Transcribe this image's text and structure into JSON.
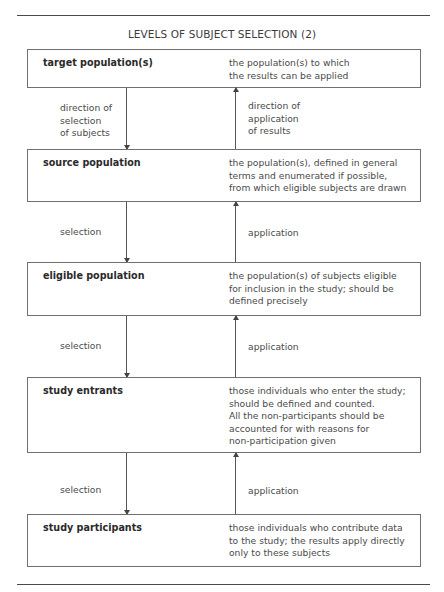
{
  "title": "LEVELS OF SUBJECT SELECTION (2)",
  "levels": [
    {
      "name": "target population(s)",
      "description": "the population(s) to which\nthe results can be applied"
    },
    {
      "name": "source population",
      "description": "the population(s), defined in general\nterms and enumerated if possible,\nfrom which eligible subjects are drawn"
    },
    {
      "name": "eligible population",
      "description": "the population(s) of subjects eligible\nfor inclusion in the study; should be\ndefined precisely"
    },
    {
      "name": "study entrants",
      "description": "those individuals who enter the study;\nshould be defined and counted.\nAll the non-participants should be\naccounted for with reasons for\nnon-participation given"
    },
    {
      "name": "study participants",
      "description": "those individuals who contribute data\nto the study; the results apply directly\nonly to these subjects"
    }
  ],
  "connectors": [
    {
      "down_label": "direction of\nselection\nof subjects",
      "up_label": "direction of\napplication\nof results"
    },
    {
      "down_label": "selection",
      "up_label": "application"
    },
    {
      "down_label": "selection",
      "up_label": "application"
    },
    {
      "down_label": "selection",
      "up_label": "application"
    }
  ]
}
